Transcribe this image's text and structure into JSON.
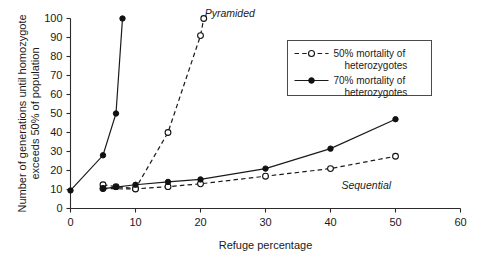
{
  "chart_data": {
    "type": "line",
    "title": "",
    "xlabel": "Refuge percentage",
    "ylabel": "Number of generations until homozygote exceeds 50% of population",
    "ylabel_line1": "Number of generations until homozygote",
    "ylabel_line2": "exceeds 50% of population",
    "xlim": [
      0,
      60
    ],
    "ylim": [
      0,
      100
    ],
    "xticks": [
      0,
      10,
      20,
      30,
      40,
      50,
      60
    ],
    "yticks": [
      0,
      10,
      20,
      30,
      40,
      50,
      60,
      70,
      80,
      90,
      100
    ],
    "grid": false,
    "legend_position": "upper right",
    "series": [
      {
        "name": "50% mortality of heterozygotes (Pyramided)",
        "group": "Pyramided",
        "style": "dashed",
        "marker": "open-circle",
        "x": [
          5,
          7,
          10,
          15,
          20,
          20.5
        ],
        "y": [
          12.5,
          11.5,
          10.5,
          40,
          91,
          100
        ]
      },
      {
        "name": "70% mortality of heterozygotes (Pyramided)",
        "group": "Pyramided",
        "style": "solid",
        "marker": "filled-circle",
        "x": [
          0,
          5,
          7,
          8
        ],
        "y": [
          9.5,
          28,
          50,
          100
        ]
      },
      {
        "name": "50% mortality of heterozygotes (Sequential)",
        "group": "Sequential",
        "style": "dashed",
        "marker": "open-circle",
        "x": [
          5,
          10,
          15,
          20,
          30,
          40,
          50
        ],
        "y": [
          10.5,
          10.3,
          11.5,
          13,
          17,
          21,
          27.5
        ]
      },
      {
        "name": "70% mortality of heterozygotes (Sequential)",
        "group": "Sequential",
        "style": "solid",
        "marker": "filled-circle",
        "x": [
          5,
          7,
          10,
          15,
          20,
          30,
          40,
          50
        ],
        "y": [
          10.5,
          11.3,
          12.5,
          14,
          15.3,
          21,
          31.5,
          47
        ]
      }
    ],
    "annotations": [
      {
        "text": "Pyramided",
        "x": 24.5,
        "y": 101,
        "style": "italic"
      },
      {
        "text": "Sequential",
        "x": 45.5,
        "y": 10.5,
        "style": "italic"
      }
    ],
    "legend": [
      {
        "label_line1": "50% mortality of",
        "label_line2": "heterozygotes",
        "style": "dashed",
        "marker": "open-circle"
      },
      {
        "label_line1": "70% mortality of",
        "label_line2": "heterozygotes",
        "style": "solid",
        "marker": "filled-circle"
      }
    ],
    "colors": {
      "line": "#1a1a1a",
      "marker_fill": "#111111",
      "marker_open": "#ffffff",
      "axis": "#2b2b2b",
      "background": "#ffffff"
    }
  }
}
